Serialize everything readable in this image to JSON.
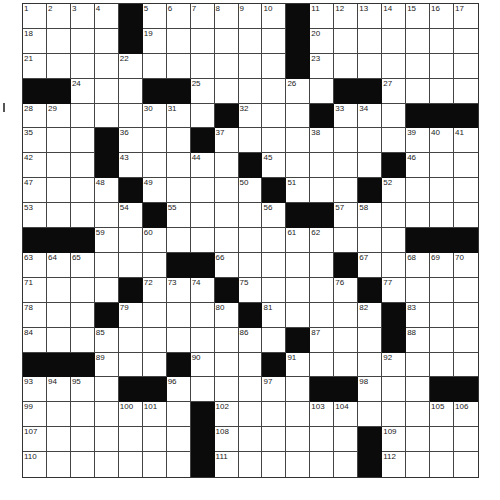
{
  "puzzle": {
    "rows": 19,
    "cols": 19,
    "grid": [
      "....#......#.......",
      "....#......#.......",
      "...........#.......",
      "##...##......##....",
      "........#...#...###",
      "...#...#...........",
      "...#.....#.....#...",
      "....#.....#...#....",
      ".....#.....##......",
      "###.............###",
      "......##.....#.....",
      "....#...#.....#....",
      "...#.....#.....#...",
      "...........#...#...",
      "###...#...#........",
      "....##......##...##",
      ".......#...........",
      ".......#......#....",
      ".......#......#...."
    ],
    "numbers": [
      [
        0,
        0,
        1
      ],
      [
        0,
        1,
        2
      ],
      [
        0,
        2,
        3
      ],
      [
        0,
        3,
        4
      ],
      [
        0,
        5,
        5
      ],
      [
        0,
        6,
        6
      ],
      [
        0,
        7,
        7
      ],
      [
        0,
        8,
        8
      ],
      [
        0,
        9,
        9
      ],
      [
        0,
        10,
        10
      ],
      [
        0,
        12,
        11
      ],
      [
        0,
        13,
        12
      ],
      [
        0,
        14,
        13
      ],
      [
        0,
        15,
        14
      ],
      [
        0,
        16,
        15
      ],
      [
        0,
        17,
        16
      ],
      [
        0,
        18,
        17
      ],
      [
        1,
        0,
        18
      ],
      [
        1,
        5,
        19
      ],
      [
        1,
        12,
        20
      ],
      [
        2,
        0,
        21
      ],
      [
        2,
        4,
        22
      ],
      [
        2,
        12,
        23
      ],
      [
        3,
        2,
        24
      ],
      [
        3,
        7,
        25
      ],
      [
        3,
        11,
        26
      ],
      [
        3,
        15,
        27
      ],
      [
        4,
        0,
        28
      ],
      [
        4,
        1,
        29
      ],
      [
        4,
        5,
        30
      ],
      [
        4,
        6,
        31
      ],
      [
        4,
        9,
        32
      ],
      [
        4,
        13,
        33
      ],
      [
        4,
        14,
        34
      ],
      [
        5,
        0,
        35
      ],
      [
        5,
        4,
        36
      ],
      [
        5,
        8,
        37
      ],
      [
        5,
        12,
        38
      ],
      [
        5,
        16,
        39
      ],
      [
        5,
        17,
        40
      ],
      [
        5,
        18,
        41
      ],
      [
        6,
        0,
        42
      ],
      [
        6,
        4,
        43
      ],
      [
        6,
        7,
        44
      ],
      [
        6,
        10,
        45
      ],
      [
        6,
        16,
        46
      ],
      [
        7,
        0,
        47
      ],
      [
        7,
        3,
        48
      ],
      [
        7,
        5,
        49
      ],
      [
        7,
        9,
        50
      ],
      [
        7,
        11,
        51
      ],
      [
        7,
        15,
        52
      ],
      [
        8,
        0,
        53
      ],
      [
        8,
        4,
        54
      ],
      [
        8,
        6,
        55
      ],
      [
        8,
        10,
        56
      ],
      [
        8,
        13,
        57
      ],
      [
        8,
        14,
        58
      ],
      [
        9,
        3,
        59
      ],
      [
        9,
        5,
        60
      ],
      [
        9,
        11,
        61
      ],
      [
        9,
        12,
        62
      ],
      [
        10,
        0,
        63
      ],
      [
        10,
        1,
        64
      ],
      [
        10,
        2,
        65
      ],
      [
        10,
        8,
        66
      ],
      [
        10,
        14,
        67
      ],
      [
        10,
        16,
        68
      ],
      [
        10,
        17,
        69
      ],
      [
        10,
        18,
        70
      ],
      [
        11,
        0,
        71
      ],
      [
        11,
        5,
        72
      ],
      [
        11,
        6,
        73
      ],
      [
        11,
        7,
        74
      ],
      [
        11,
        9,
        75
      ],
      [
        11,
        13,
        76
      ],
      [
        11,
        15,
        77
      ],
      [
        12,
        0,
        78
      ],
      [
        12,
        4,
        79
      ],
      [
        12,
        8,
        80
      ],
      [
        12,
        10,
        81
      ],
      [
        12,
        14,
        82
      ],
      [
        12,
        16,
        83
      ],
      [
        13,
        0,
        84
      ],
      [
        13,
        3,
        85
      ],
      [
        13,
        9,
        86
      ],
      [
        13,
        12,
        87
      ],
      [
        13,
        16,
        88
      ],
      [
        14,
        3,
        89
      ],
      [
        14,
        7,
        90
      ],
      [
        14,
        11,
        91
      ],
      [
        14,
        15,
        92
      ],
      [
        15,
        0,
        93
      ],
      [
        15,
        1,
        94
      ],
      [
        15,
        2,
        95
      ],
      [
        15,
        6,
        96
      ],
      [
        15,
        10,
        97
      ],
      [
        15,
        14,
        98
      ],
      [
        16,
        0,
        99
      ],
      [
        16,
        4,
        100
      ],
      [
        16,
        5,
        101
      ],
      [
        16,
        8,
        102
      ],
      [
        16,
        12,
        103
      ],
      [
        16,
        13,
        104
      ],
      [
        16,
        17,
        105
      ],
      [
        16,
        18,
        106
      ],
      [
        17,
        0,
        107
      ],
      [
        17,
        8,
        108
      ],
      [
        17,
        15,
        109
      ],
      [
        18,
        0,
        110
      ],
      [
        18,
        8,
        111
      ],
      [
        18,
        15,
        112
      ]
    ]
  },
  "colors": {
    "black_square": "#0b0b0b",
    "grid_line": "#444444",
    "number_text": "#222222",
    "background": "#ffffff"
  }
}
